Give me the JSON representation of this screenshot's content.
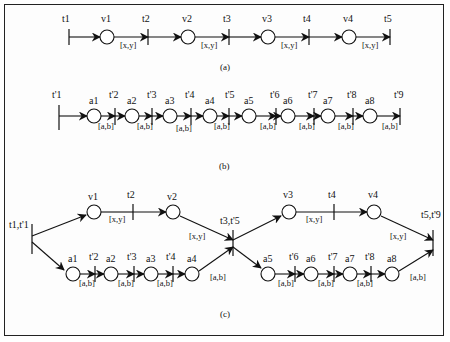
{
  "figure": {
    "type": "Petri net timing diagram",
    "panels": [
      {
        "id": "a",
        "caption": "(a)",
        "transitions": [
          "t1",
          "t2",
          "t3",
          "t4",
          "t5"
        ],
        "places": [
          "v1",
          "v2",
          "v3",
          "v4"
        ],
        "interval_label": "[x,y]"
      },
      {
        "id": "b",
        "caption": "(b)",
        "transitions": [
          "t'1",
          "t'2",
          "t'3",
          "t'4",
          "t'5",
          "t'6",
          "t'7",
          "t'8",
          "t'9"
        ],
        "places": [
          "a1",
          "a2",
          "a3",
          "a4",
          "a5",
          "a6",
          "a7",
          "a8"
        ],
        "interval_label": "[a,b]"
      },
      {
        "id": "c",
        "caption": "(c)",
        "fork": "t1,t'1",
        "merge_mid": "t3,t'5",
        "merge_end": "t5,t'9",
        "top_transitions": [
          "t2",
          "t4"
        ],
        "top_places": [
          "v1",
          "v2",
          "v3",
          "v4"
        ],
        "bottom_transitions": [
          "t'2",
          "t'3",
          "t'4",
          "t'6",
          "t'7",
          "t'8"
        ],
        "bottom_places": [
          "a1",
          "a2",
          "a3",
          "a4",
          "a5",
          "a6",
          "a7",
          "a8"
        ],
        "top_interval": "[x,y]",
        "bottom_interval": "[a,b]"
      }
    ]
  },
  "labels": {
    "a_t1": "t1",
    "a_t2": "t2",
    "a_t3": "t3",
    "a_t4": "t4",
    "a_t5": "t5",
    "a_v1": "v1",
    "a_v2": "v2",
    "a_v3": "v3",
    "a_v4": "v4",
    "xy": "[x,y]",
    "ab": "[a,b]",
    "b_t1": "t'1",
    "b_t2": "t'2",
    "b_t3": "t'3",
    "b_t4": "t'4",
    "b_t5": "t'5",
    "b_t6": "t'6",
    "b_t7": "t'7",
    "b_t8": "t'8",
    "b_t9": "t'9",
    "b_a1": "a1",
    "b_a2": "a2",
    "b_a3": "a3",
    "b_a4": "a4",
    "b_a5": "a5",
    "b_a6": "a6",
    "b_a7": "a7",
    "b_a8": "a8",
    "c_fork": "t1,t'1",
    "c_mid": "t3,t'5",
    "c_end": "t5,t'9",
    "cap_a": "(a)",
    "cap_b": "(b)",
    "cap_c": "(c)"
  }
}
